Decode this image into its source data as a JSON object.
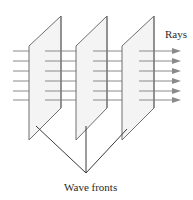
{
  "diagram": {
    "labels": {
      "rays": "Rays",
      "wave_fronts": "Wave fronts"
    },
    "colors": {
      "plane_fill": "#f4f4f4",
      "plane_stroke": "#6e6e6e",
      "ray_stroke": "#8a8a8a",
      "arrow_fill": "#8a8a8a",
      "leader_stroke": "#3a3a3a",
      "text": "#2a2a2a"
    },
    "planes": [
      {
        "id": "wave-front-1",
        "points": [
          [
            29,
            46
          ],
          [
            61,
            16
          ],
          [
            61,
            108
          ],
          [
            29,
            140
          ]
        ]
      },
      {
        "id": "wave-front-2",
        "points": [
          [
            76,
            46
          ],
          [
            107,
            16
          ],
          [
            107,
            108
          ],
          [
            76,
            140
          ]
        ]
      },
      {
        "id": "wave-front-3",
        "points": [
          [
            122,
            46
          ],
          [
            154,
            16
          ],
          [
            154,
            108
          ],
          [
            122,
            140
          ]
        ]
      }
    ],
    "ray_y": [
      51,
      61,
      71,
      81,
      91,
      100
    ],
    "ray_segments": [
      [
        13,
        29
      ],
      [
        45,
        76
      ],
      [
        93,
        122
      ],
      [
        139,
        174
      ]
    ],
    "arrowhead": {
      "tip_x": 181,
      "base_x": 172,
      "half_height": 3
    },
    "leader_lines": [
      {
        "from": [
          36,
          126
        ],
        "to": [
          86,
          173
        ]
      },
      {
        "from": [
          86,
          126
        ],
        "to": [
          86,
          173
        ]
      },
      {
        "from": [
          127,
          129
        ],
        "to": [
          86,
          173
        ]
      }
    ]
  }
}
